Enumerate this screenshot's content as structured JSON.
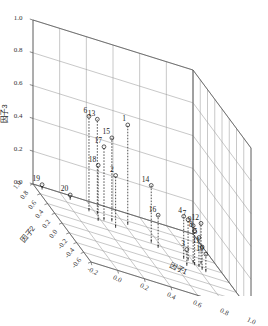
{
  "chart_data": {
    "type": "scatter",
    "title": "",
    "xlabel": "因子1",
    "ylabel": "因子2",
    "zlabel": "因子3",
    "xlim": [
      -0.2,
      1.0
    ],
    "ylim": [
      -0.6,
      1.0
    ],
    "zlim": [
      0.0,
      1.0
    ],
    "xticks": [
      "-0.2",
      "0.0",
      "0.2",
      "0.4",
      "0.6",
      "0.8",
      "1.0"
    ],
    "yticks": [
      "1.0",
      "0.8",
      "0.6",
      "0.4",
      "0.2",
      "0.0",
      "-0.2",
      "-0.4",
      "-0.6"
    ],
    "zticks": [
      "0.0",
      "0.2",
      "0.4",
      "0.6",
      "0.8",
      "1.0"
    ],
    "grid": true,
    "legend": "none",
    "marker": "open-circle",
    "stem_style": "dashed-drop-line",
    "points": [
      {
        "label": "1",
        "x": 0.44,
        "y": 0.74,
        "z": 0.6
      },
      {
        "label": "2",
        "x": 0.3,
        "y": 0.56,
        "z": 0.31
      },
      {
        "label": "3",
        "x": 0.72,
        "y": 0.14,
        "z": 0.09
      },
      {
        "label": "4",
        "x": 0.74,
        "y": 0.3,
        "z": 0.25
      },
      {
        "label": "5",
        "x": 0.83,
        "y": 0.21,
        "z": 0.17
      },
      {
        "label": "6",
        "x": 0.16,
        "y": 0.78,
        "z": 0.57
      },
      {
        "label": "7",
        "x": 0.77,
        "y": 0.29,
        "z": 0.24
      },
      {
        "label": "8",
        "x": 0.8,
        "y": 0.22,
        "z": 0.2
      },
      {
        "label": "9",
        "x": 0.8,
        "y": 0.26,
        "z": 0.22
      },
      {
        "label": "10",
        "x": 0.86,
        "y": 0.13,
        "z": 0.1
      },
      {
        "label": "11",
        "x": 0.84,
        "y": 0.16,
        "z": 0.13
      },
      {
        "label": "12",
        "x": 0.87,
        "y": 0.3,
        "z": 0.24
      },
      {
        "label": "13",
        "x": 0.22,
        "y": 0.77,
        "z": 0.57
      },
      {
        "label": "14",
        "x": 0.54,
        "y": 0.46,
        "z": 0.34
      },
      {
        "label": "15",
        "x": 0.31,
        "y": 0.7,
        "z": 0.5
      },
      {
        "label": "16",
        "x": 0.57,
        "y": 0.38,
        "z": 0.19
      },
      {
        "label": "17",
        "x": 0.24,
        "y": 0.66,
        "z": 0.44
      },
      {
        "label": "18",
        "x": 0.18,
        "y": 0.6,
        "z": 0.33
      },
      {
        "label": "19",
        "x": -0.14,
        "y": 0.97,
        "z": 0.02
      },
      {
        "label": "20",
        "x": 0.06,
        "y": 0.93,
        "z": 0.02
      }
    ]
  },
  "axes": {
    "z_title": "因子3",
    "y_title": "因子2",
    "x_title": "因子1"
  },
  "colors": {
    "frame": "#5a5a5a",
    "grid": "#9a9a9a",
    "marker": "#1a1a1a",
    "stem": "#1a1a1a",
    "text": "#2b2b2b",
    "background": "#ffffff"
  }
}
